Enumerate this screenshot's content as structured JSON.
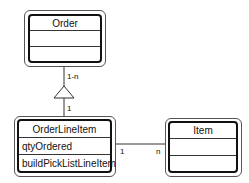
{
  "diagram": {
    "type": "uml-class",
    "classes": [
      {
        "name": "Order",
        "attributes": [],
        "operations": []
      },
      {
        "name": "OrderLineItem",
        "attributes": [
          "qtyOrdered"
        ],
        "operations": [
          "buildPickListLineItem"
        ]
      },
      {
        "name": "Item",
        "attributes": [],
        "operations": []
      }
    ],
    "associations": [
      {
        "from": "Order",
        "to": "OrderLineItem",
        "kind": "aggregation",
        "from_multiplicity": "1-n",
        "to_multiplicity": "1"
      },
      {
        "from": "OrderLineItem",
        "to": "Item",
        "kind": "association",
        "from_multiplicity": "1",
        "to_multiplicity": "n"
      }
    ]
  },
  "labels": {
    "order_mult": "1-n",
    "oli_mult": "1",
    "oli_item_left": "1",
    "oli_item_right": "n"
  },
  "colors": {
    "line": "#333333",
    "border": "#111111",
    "background": "#ffffff"
  }
}
